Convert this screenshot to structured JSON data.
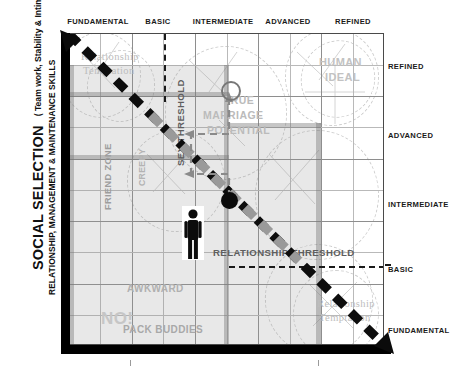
{
  "axes": {
    "y_title": "SOCIAL SELECTION",
    "y_paren": "(  Team work, Stability & Intimacy )",
    "y_subtitle": "RELATIONSHIP, MANAGEMENT & MAINTENANCE SKILLS",
    "x_categories": [
      "FUNDAMENTAL",
      "BASIC",
      "INTERMEDIATE",
      "ADVANCED",
      "REFINED"
    ],
    "y_categories_top_to_bottom": [
      "REFINED",
      "ADVANCED",
      "INTERMEDIATE",
      "BASIC",
      "FUNDAMENTAL"
    ]
  },
  "regions": {
    "friend_zone": "FRIEND ZONE",
    "creepy": "CREEPY",
    "no": "NO!",
    "awkward": "AWKWARD",
    "pack_buddies": "PACK BUDDIES",
    "human_ideal_line1": "HUMAN",
    "human_ideal_line2": "IDEAL",
    "true_marriage_line1": "TRUE",
    "true_marriage_line2": "MARRIAGE",
    "true_marriage_line3": "POTENTIAL",
    "temptation_tl_line1": "Relationship",
    "temptation_tl_line2": "Temptation",
    "temptation_br_line1": "Relationship",
    "temptation_br_line2": "Temptation"
  },
  "thresholds": {
    "sex_threshold": "SEX THRESHOLD",
    "relationship_threshold": "RELATIONSHIP THRESHOLD"
  },
  "markers": {
    "current_state_label": "current-state-dot",
    "goal_label": "true-marriage-potential-ring",
    "person_label": "person-figure"
  },
  "colors": {
    "axis_black": "#000000",
    "grid_light": "#b9b9b9",
    "grid_major": "#8e8e8e",
    "shade_fill": "#c4c4c4",
    "band": "#9a9a9a",
    "label_gray": "#b3b3b3",
    "ring_gray": "#777777"
  }
}
